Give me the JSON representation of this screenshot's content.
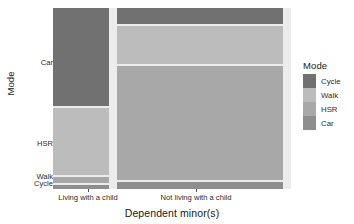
{
  "axes": {
    "x_title": "Dependent minor(s)",
    "y_title": "Mode",
    "x_ticks": [
      {
        "label": "Living with a child",
        "center_pct": 14.7
      },
      {
        "label": "Not living with a child",
        "center_pct": 60.1
      }
    ],
    "y_ticks": [
      {
        "label": "Car",
        "top_px": 58
      },
      {
        "label": "HSR",
        "top_px": 139
      },
      {
        "label": "Walk",
        "top_px": 172
      },
      {
        "label": "Cycle",
        "top_px": 179
      }
    ]
  },
  "legend": {
    "title": "Mode",
    "items": [
      {
        "label": "Cycle",
        "color": "#717171"
      },
      {
        "label": "Walk",
        "color": "#bcbcbc"
      },
      {
        "label": "HSR",
        "color": "#a8a8a8"
      },
      {
        "label": "Car",
        "color": "#8e8e8e"
      }
    ]
  },
  "panel": {
    "background": "#ececec",
    "gap_color": "#ffffff"
  },
  "chart_data": {
    "type": "bar",
    "subtype": "mosaic",
    "title": "",
    "xlabel": "Dependent minor(s)",
    "ylabel": "Mode",
    "legend_title": "Mode",
    "legend_position": "right",
    "grid": false,
    "categories": [
      "Living with a child",
      "Not living with a child"
    ],
    "column_widths_pct": [
      23.5,
      73.0
    ],
    "series": [
      {
        "name": "Cycle",
        "color": "#717171",
        "values_pct": [
          54.0,
          9.0
        ]
      },
      {
        "name": "Walk",
        "color": "#bcbcbc",
        "values_pct": [
          38.0,
          21.0
        ]
      },
      {
        "name": "HSR",
        "color": "#a8a8a8",
        "values_pct": [
          4.5,
          66.0
        ]
      },
      {
        "name": "Car",
        "color": "#8e8e8e",
        "values_pct": [
          3.5,
          4.0
        ]
      }
    ],
    "tiles": [
      {
        "column": "Living with a child",
        "mode": "Cycle",
        "color": "#717171",
        "x_pct": 0.0,
        "w_pct": 23.5,
        "y_pct": 0.0,
        "h_pct": 54.0
      },
      {
        "column": "Living with a child",
        "mode": "Walk",
        "color": "#bcbcbc",
        "x_pct": 0.0,
        "w_pct": 23.5,
        "y_pct": 55.2,
        "h_pct": 37.3
      },
      {
        "column": "Living with a child",
        "mode": "HSR",
        "color": "#a8a8a8",
        "x_pct": 0.0,
        "w_pct": 23.5,
        "y_pct": 93.6,
        "h_pct": 3.3
      },
      {
        "column": "Living with a child",
        "mode": "Car",
        "color": "#8e8e8e",
        "x_pct": 0.0,
        "w_pct": 23.5,
        "y_pct": 98.0,
        "h_pct": 2.0
      },
      {
        "column": "Not living with a child",
        "mode": "Cycle",
        "color": "#717171",
        "x_pct": 26.8,
        "w_pct": 69.7,
        "y_pct": 0.0,
        "h_pct": 9.0
      },
      {
        "column": "Not living with a child",
        "mode": "Walk",
        "color": "#bcbcbc",
        "x_pct": 26.8,
        "w_pct": 69.7,
        "y_pct": 10.2,
        "h_pct": 20.5
      },
      {
        "column": "Not living with a child",
        "mode": "HSR",
        "color": "#a8a8a8",
        "x_pct": 26.8,
        "w_pct": 69.7,
        "y_pct": 31.8,
        "h_pct": 63.4
      },
      {
        "column": "Not living with a child",
        "mode": "Car",
        "color": "#8e8e8e",
        "x_pct": 26.8,
        "w_pct": 69.7,
        "y_pct": 96.3,
        "h_pct": 3.7
      }
    ]
  }
}
